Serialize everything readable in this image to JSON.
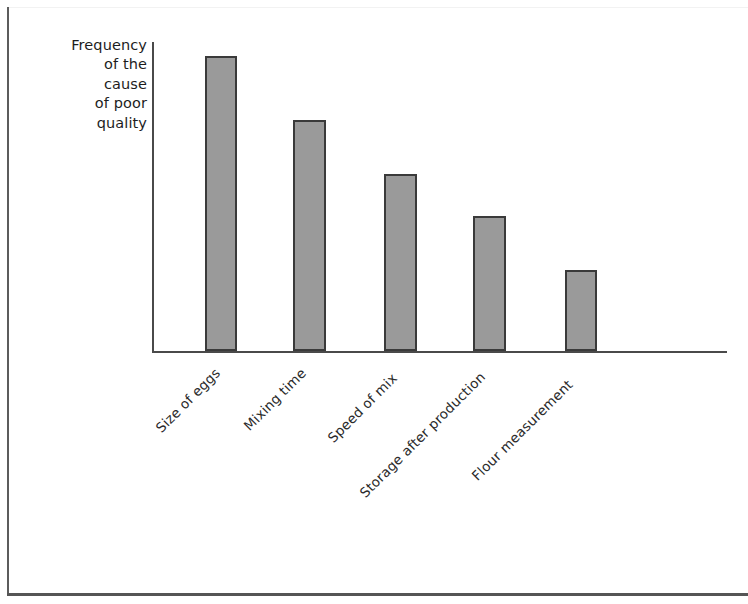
{
  "figure": {
    "background_color": "#ffffff",
    "frame_color": "#555555"
  },
  "chart_data": {
    "type": "bar",
    "title": "",
    "xlabel": "",
    "ylabel": "Frequency of the cause of poor quality",
    "ylabel_lines": [
      "Frequency",
      "of the",
      "cause",
      "of poor",
      "quality"
    ],
    "categories": [
      "Size of eggs",
      "Mixing time",
      "Speed of mix",
      "Storage after production",
      "Flour measurement"
    ],
    "values": [
      295,
      231,
      177,
      135,
      81
    ],
    "value_unit": "px-height",
    "ylim": [
      0,
      311
    ],
    "grid": false,
    "legend": null,
    "bar_fill_color": "#9a9a9a",
    "bar_edge_color": "#3a3a3a",
    "axis_color": "#4a4a4a",
    "label_rotation_degrees": 45,
    "bars": [
      {
        "category": "Size of eggs",
        "value": 295,
        "left": 205,
        "top": 56,
        "width": 32,
        "height": 295
      },
      {
        "category": "Mixing time",
        "value": 231,
        "left": 293,
        "top": 120,
        "width": 33,
        "height": 231
      },
      {
        "category": "Speed of mix",
        "value": 177,
        "left": 384,
        "top": 174,
        "width": 33,
        "height": 177
      },
      {
        "category": "Storage after production",
        "value": 135,
        "left": 473,
        "top": 216,
        "width": 33,
        "height": 135
      },
      {
        "category": "Flour measurement",
        "value": 81,
        "left": 565,
        "top": 270,
        "width": 32,
        "height": 81
      }
    ],
    "label_positions": [
      {
        "left": 158,
        "top": 422
      },
      {
        "left": 246,
        "top": 420
      },
      {
        "left": 330,
        "top": 432
      },
      {
        "left": 362,
        "top": 487
      },
      {
        "left": 474,
        "top": 470
      }
    ]
  }
}
